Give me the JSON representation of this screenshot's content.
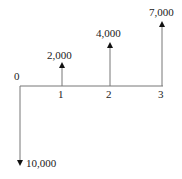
{
  "diagram": {
    "type": "cash-flow-diagram",
    "periods": [
      "0",
      "1",
      "2",
      "3"
    ],
    "flows": [
      {
        "period": "0",
        "amount": "10,000",
        "direction": "down"
      },
      {
        "period": "1",
        "amount": "2,000",
        "direction": "up"
      },
      {
        "period": "2",
        "amount": "4,000",
        "direction": "up"
      },
      {
        "period": "3",
        "amount": "7,000",
        "direction": "up"
      }
    ]
  }
}
